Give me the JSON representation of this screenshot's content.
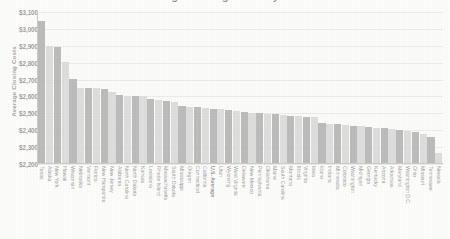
{
  "title": {
    "text": "Average Closing Costs by State",
    "note": "cropped at top edge of screenshot"
  },
  "axis": {
    "y_title": "Average Closing Costs",
    "y_ticks": [
      "$3,100",
      "$3,000",
      "$2,900",
      "$2,800",
      "$2,700",
      "$2,600",
      "$2,500",
      "$2,400",
      "$2,300",
      "$2,200"
    ]
  },
  "colors": {
    "bar_dark": "#6f6f6f",
    "bar_light": "#b9b9b9",
    "grid": "#d8d8d6",
    "axis": "#8f8f8d",
    "background": "#fbfbfa",
    "text": "#2b2b2b"
  },
  "chart_data": {
    "type": "bar",
    "title": "Average Closing Costs by State",
    "xlabel": "",
    "ylabel": "Average Closing Costs",
    "ylim": [
      2200,
      3100
    ],
    "ytick_step": 100,
    "grid": true,
    "legend": "none",
    "categories": [
      "Texas",
      "Alaska",
      "New York",
      "Hawaii",
      "Wisconsin",
      "Nebraska",
      "Vermont",
      "Florida",
      "New Hampshire",
      "New Jersey",
      "Alabama",
      "North Carolina",
      "North Dakota",
      "Kansas",
      "Louisiana",
      "Rhode Island",
      "Massachusetts",
      "South Dakota",
      "Mississippi",
      "Oregon",
      "Connecticut",
      "California",
      "U.S. Average",
      "Utah",
      "Wyoming",
      "West Virginia",
      "Delaware",
      "New Mexico",
      "Pennsylvania",
      "Oklahoma",
      "Maine",
      "South Carolina",
      "Montana",
      "Illinois",
      "Virginia",
      "Iowa",
      "Idaho",
      "Indiana",
      "Minnesota",
      "Colorado",
      "Washington",
      "Michigan",
      "Georgia",
      "Kentucky",
      "Arizona",
      "Arkansas",
      "Maryland",
      "Washington D.C.",
      "Ohio",
      "Missouri",
      "Tennessee",
      "Nevada"
    ],
    "values": [
      3046,
      2897,
      2892,
      2806,
      2706,
      2653,
      2650,
      2649,
      2645,
      2628,
      2610,
      2605,
      2603,
      2600,
      2585,
      2580,
      2576,
      2570,
      2546,
      2540,
      2536,
      2530,
      2528,
      2524,
      2520,
      2512,
      2508,
      2505,
      2500,
      2498,
      2495,
      2490,
      2487,
      2484,
      2480,
      2478,
      2440,
      2438,
      2436,
      2432,
      2428,
      2424,
      2420,
      2416,
      2412,
      2408,
      2400,
      2394,
      2388,
      2375,
      2360,
      2265
    ],
    "value_prefix": "$",
    "highlight_category": "U.S. Average"
  }
}
